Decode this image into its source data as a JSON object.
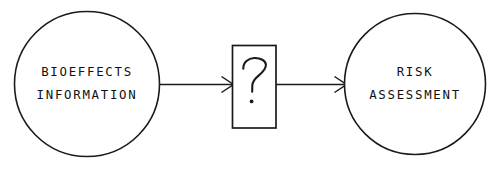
{
  "diagram": {
    "background_color": "#ffffff",
    "stroke_color": "#1a1a1a",
    "text_color": "#111111",
    "nodes": [
      {
        "id": "bioeffects",
        "shape": "circle",
        "label_line_1": "BIOEFFECTS",
        "label_line_2": "INFORMATION",
        "cx": 87,
        "cy": 84,
        "r": 72
      },
      {
        "id": "unknown",
        "shape": "rectangle",
        "label": "?",
        "x": 232,
        "y": 45,
        "width": 44,
        "height": 83
      },
      {
        "id": "risk",
        "shape": "circle",
        "label_line_1": "RISK",
        "label_line_2": "ASSESSMENT",
        "cx": 415,
        "cy": 84,
        "r": 70
      }
    ],
    "connectors": [
      {
        "id": "arrow-1",
        "from": "bioeffects",
        "to": "unknown",
        "x1": 160,
        "x2": 233,
        "y": 84,
        "arrowhead": "open-v"
      },
      {
        "id": "arrow-2",
        "from": "unknown",
        "to": "risk",
        "x1": 276,
        "x2": 346,
        "y": 84,
        "arrowhead": "open-v"
      }
    ]
  }
}
